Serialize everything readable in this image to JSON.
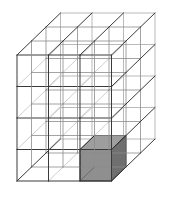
{
  "figure": {
    "name": "3d-unit-cube-grid",
    "grid": {
      "columns_x": 3,
      "depth_y": 3,
      "rows_z": 4,
      "total_cubes": 36
    },
    "highlighted_cube": {
      "label": "shaded-cube",
      "x_index": 2,
      "y_index": 0,
      "z_index": 0,
      "position_description": "front row, right column, bottom layer"
    },
    "projection": {
      "type": "oblique",
      "unit_x_px": 31.5,
      "unit_z_px": 31.5,
      "depth_dx_px": 14.5,
      "depth_dy_px": -14.0,
      "origin_x_px": 17,
      "origin_y_px": 181
    },
    "colors": {
      "background": "#ffffff",
      "edge_front": "#3a3a3a",
      "edge_hidden": "#b9b9b9",
      "edge_mid": "#8c8c8c",
      "shade_top": "#9e9e9e",
      "shade_front": "#8f8f8f",
      "shade_side": "#6f6f6f",
      "shade_outline": "#2d2d2d"
    },
    "stroke": {
      "outer_width": 1.0,
      "inner_width": 0.8,
      "hidden_width": 0.7
    }
  }
}
